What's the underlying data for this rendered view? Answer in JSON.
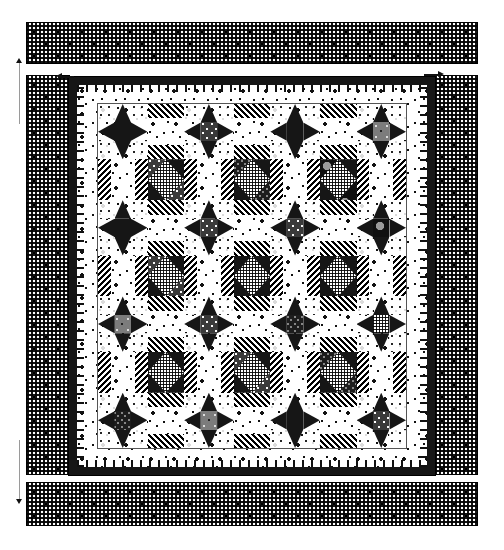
{
  "figure": {
    "caption_top": "",
    "background_color": "#ffffff"
  },
  "palette": {
    "ink": "#000000",
    "dark_fabric": "#161616",
    "medium_fabric": "#4a4a4a",
    "light_fabric": "#ffffff",
    "binding": "#1a1a1a",
    "dimension_line": "#9a9a9a"
  },
  "quilt": {
    "name": "pieced sampler quilt",
    "layers": [
      {
        "name": "outer-binding",
        "fabric": "solid-dark",
        "color": "#1a1a1a"
      },
      {
        "name": "inner-floral-border",
        "fabric": "white-floral-print",
        "color": "#ffffff"
      },
      {
        "name": "block-field",
        "fabric": "pieced-blocks",
        "color": "#ffffff"
      }
    ],
    "grid": {
      "rows": 7,
      "columns": 7,
      "block_rows": [
        1,
        3,
        5,
        7
      ],
      "sashing_rows": [
        2,
        4,
        6
      ],
      "description": "alternating sawtooth-star blocks and rickrack sashing with pinwheel cornerstones"
    },
    "cells": [
      [
        {
          "type": "star",
          "center": "dark",
          "points": "dark",
          "ground": "floral"
        },
        {
          "type": "sash-h",
          "fabric": "rickrack-floral"
        },
        {
          "type": "star",
          "center": "speckle",
          "points": "dark",
          "ground": "floral"
        },
        {
          "type": "sash-h",
          "fabric": "rickrack-floral"
        },
        {
          "type": "star",
          "center": "dark",
          "points": "dark",
          "ground": "floral"
        },
        {
          "type": "sash-h",
          "fabric": "rickrack-floral"
        },
        {
          "type": "star",
          "center": "grey",
          "points": "dark",
          "ground": "floral"
        }
      ],
      [
        {
          "type": "sash-v",
          "fabric": "rickrack-floral"
        },
        {
          "type": "pinwheel",
          "ground": "gingham",
          "blades": "dark-speckle"
        },
        {
          "type": "sash-v",
          "fabric": "rickrack-floral"
        },
        {
          "type": "pinwheel",
          "ground": "gingham",
          "blades": "noise-dark"
        },
        {
          "type": "sash-v",
          "fabric": "rickrack-floral"
        },
        {
          "type": "pinwheel",
          "ground": "gingham",
          "blades": "bigdot-dark"
        },
        {
          "type": "sash-v",
          "fabric": "rickrack-floral"
        }
      ],
      [
        {
          "type": "star",
          "center": "dark",
          "points": "dark",
          "ground": "floral"
        },
        {
          "type": "sash-h",
          "fabric": "rickrack-floral"
        },
        {
          "type": "star",
          "center": "speckle",
          "points": "dark",
          "ground": "floral"
        },
        {
          "type": "sash-h",
          "fabric": "rickrack-floral"
        },
        {
          "type": "star",
          "center": "speckle",
          "points": "dark",
          "ground": "floral"
        },
        {
          "type": "sash-h",
          "fabric": "rickrack-floral"
        },
        {
          "type": "star",
          "center": "bigdot",
          "points": "dark",
          "ground": "floral"
        }
      ],
      [
        {
          "type": "sash-v",
          "fabric": "rickrack-floral"
        },
        {
          "type": "pinwheel",
          "ground": "gingham",
          "blades": "dark-speckle"
        },
        {
          "type": "sash-v",
          "fabric": "rickrack-floral"
        },
        {
          "type": "pinwheel",
          "ground": "gingham",
          "blades": "dark-solid"
        },
        {
          "type": "sash-v",
          "fabric": "rickrack-floral"
        },
        {
          "type": "pinwheel",
          "ground": "gingham",
          "blades": "dark-solid"
        },
        {
          "type": "sash-v",
          "fabric": "rickrack-floral"
        }
      ],
      [
        {
          "type": "star",
          "center": "grey",
          "points": "dark",
          "ground": "floral"
        },
        {
          "type": "sash-h",
          "fabric": "rickrack-floral"
        },
        {
          "type": "star",
          "center": "speckle",
          "points": "dark",
          "ground": "floral"
        },
        {
          "type": "sash-h",
          "fabric": "rickrack-floral"
        },
        {
          "type": "star",
          "center": "noise",
          "points": "dark",
          "ground": "floral"
        },
        {
          "type": "sash-h",
          "fabric": "rickrack-floral"
        },
        {
          "type": "star",
          "center": "gingham",
          "points": "dark",
          "ground": "floral"
        }
      ],
      [
        {
          "type": "sash-v",
          "fabric": "rickrack-floral"
        },
        {
          "type": "pinwheel",
          "ground": "gingham",
          "blades": "dark-solid"
        },
        {
          "type": "sash-v",
          "fabric": "rickrack-floral"
        },
        {
          "type": "pinwheel",
          "ground": "gingham",
          "blades": "dark-speckle"
        },
        {
          "type": "sash-v",
          "fabric": "rickrack-floral"
        },
        {
          "type": "pinwheel",
          "ground": "gingham",
          "blades": "noise-dark"
        },
        {
          "type": "sash-v",
          "fabric": "rickrack-floral"
        }
      ],
      [
        {
          "type": "star",
          "center": "noise",
          "points": "dark",
          "ground": "floral"
        },
        {
          "type": "sash-h",
          "fabric": "rickrack-floral"
        },
        {
          "type": "star",
          "center": "grey",
          "points": "dark",
          "ground": "floral"
        },
        {
          "type": "sash-h",
          "fabric": "rickrack-floral"
        },
        {
          "type": "star",
          "center": "dark",
          "points": "dark",
          "ground": "floral"
        },
        {
          "type": "sash-h",
          "fabric": "rickrack-floral"
        },
        {
          "type": "star",
          "center": "speckle",
          "points": "dark",
          "ground": "floral"
        }
      ]
    ]
  },
  "binding_strips": [
    {
      "name": "top-binding-strip",
      "fabric": "gingham-check",
      "position": "above-quilt"
    },
    {
      "name": "bottom-binding-strip",
      "fabric": "gingham-check",
      "position": "below-quilt"
    }
  ],
  "side_borders": [
    {
      "name": "left-side-border",
      "fabric": "gingham-check"
    },
    {
      "name": "right-side-border",
      "fabric": "gingham-check"
    }
  ],
  "markers": {
    "left_dimension": {
      "name": "height-dimension",
      "label": ""
    },
    "top_left_arrow": {
      "name": "seam-direction-arrow-left",
      "label": ""
    },
    "top_right_arrow": {
      "name": "seam-direction-arrow-right",
      "label": ""
    },
    "bottom_left_arrow": {
      "name": "seam-direction-arrow-bottom",
      "label": ""
    }
  }
}
